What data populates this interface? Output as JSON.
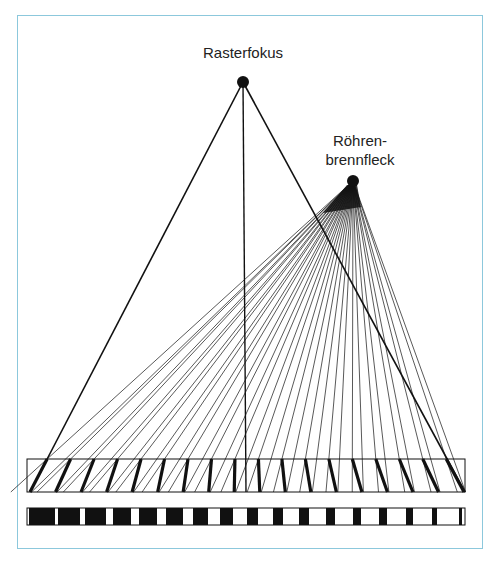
{
  "labels": {
    "raster_focus": "Rasterfokus",
    "tube_focus_line1": "Röhren-",
    "tube_focus_line2": "brennfleck"
  },
  "colors": {
    "frame": "#8cc8dc",
    "ink": "#111111"
  },
  "geometry": {
    "raster_focus": [
      243,
      82
    ],
    "tube_focus": [
      353,
      181
    ],
    "grid_box": {
      "x1": 27,
      "x2": 465,
      "top": 459,
      "bottom": 492
    },
    "strip": {
      "x1": 27,
      "x2": 465,
      "top": 508,
      "bottom": 525
    },
    "lamella_bottom_start": 30,
    "lamella_spacing": 25.53,
    "lamella_count": 18,
    "strip_blocks": [
      [
        29,
        55
      ],
      [
        58,
        80
      ],
      [
        85,
        106
      ],
      [
        113,
        131
      ],
      [
        139,
        157
      ],
      [
        166,
        183
      ],
      [
        193,
        208
      ],
      [
        220,
        233
      ],
      [
        247,
        258
      ],
      [
        273,
        283
      ],
      [
        299,
        309
      ],
      [
        326,
        335
      ],
      [
        353,
        361
      ],
      [
        379,
        387
      ],
      [
        406,
        413
      ],
      [
        432,
        437
      ],
      [
        459,
        462
      ]
    ]
  }
}
